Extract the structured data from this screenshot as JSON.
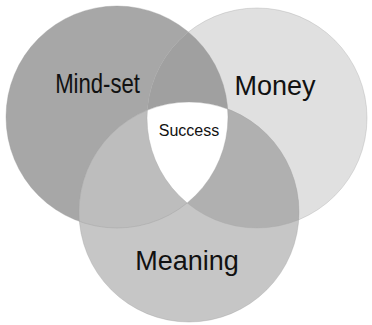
{
  "diagram": {
    "type": "venn",
    "circles": [
      {
        "id": "mindset",
        "label": "Mind-set",
        "color": "#a7a7a7",
        "cx": 117,
        "cy": 117,
        "r": 111
      },
      {
        "id": "money",
        "label": "Money",
        "color": "#e0e0e0",
        "cx": 257,
        "cy": 118,
        "r": 110
      },
      {
        "id": "meaning",
        "label": "Meaning",
        "color": "#c6c6c6",
        "cx": 189,
        "cy": 212,
        "r": 110
      }
    ],
    "center": {
      "label": "Success",
      "color": "#ffffff"
    },
    "overlap_colors": {
      "mindset_money": "#a0a0a0",
      "mindset_meaning": "#bdbdbd",
      "money_meaning": "#b0b0b0"
    }
  }
}
